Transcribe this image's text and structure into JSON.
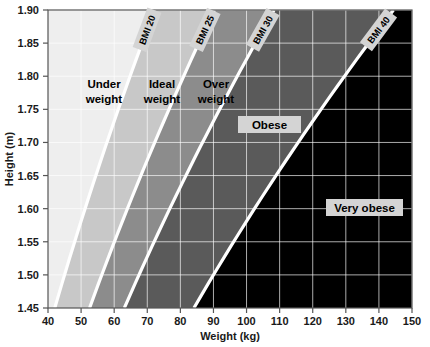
{
  "chart_data": {
    "type": "line",
    "title": "",
    "xlabel": "Weight (kg)",
    "ylabel": "Height (m)",
    "xlim": [
      40,
      150
    ],
    "ylim": [
      1.45,
      1.9
    ],
    "grid": true,
    "legend_position": "none",
    "x_ticks": [
      "40",
      "50",
      "60",
      "70",
      "80",
      "90",
      "100",
      "110",
      "120",
      "130",
      "140",
      "150"
    ],
    "x_tick_values": [
      40,
      50,
      60,
      70,
      80,
      90,
      100,
      110,
      120,
      130,
      140,
      150
    ],
    "y_ticks": [
      "1.45",
      "1.50",
      "1.55",
      "1.60",
      "1.65",
      "1.70",
      "1.75",
      "1.80",
      "1.85",
      "1.90"
    ],
    "y_tick_values": [
      1.45,
      1.5,
      1.55,
      1.6,
      1.65,
      1.7,
      1.75,
      1.8,
      1.85,
      1.9
    ],
    "series": [
      {
        "name": "BMI 20",
        "bmi": 20,
        "label": "BMI 20",
        "points": [
          {
            "height": 1.45,
            "weight": 42.1
          },
          {
            "height": 1.9,
            "weight": 72.2
          }
        ]
      },
      {
        "name": "BMI 25",
        "bmi": 25,
        "label": "BMI 25",
        "points": [
          {
            "height": 1.45,
            "weight": 52.6
          },
          {
            "height": 1.9,
            "weight": 90.3
          }
        ]
      },
      {
        "name": "BMI 30",
        "bmi": 30,
        "label": "BMI 30",
        "points": [
          {
            "height": 1.45,
            "weight": 63.1
          },
          {
            "height": 1.9,
            "weight": 108.3
          }
        ]
      },
      {
        "name": "BMI 40",
        "bmi": 40,
        "label": "BMI 40",
        "points": [
          {
            "height": 1.45,
            "weight": 84.1
          },
          {
            "height": 1.9,
            "weight": 144.4
          }
        ]
      }
    ],
    "regions": [
      {
        "name": "under-weight",
        "label_line1": "Under",
        "label_line2": "weight",
        "bmi_range": [
          0,
          20
        ],
        "fill": "#eeeeee",
        "boxed": false
      },
      {
        "name": "ideal-weight",
        "label_line1": "Ideal",
        "label_line2": "weight",
        "bmi_range": [
          20,
          25
        ],
        "fill": "#c8c8c8",
        "boxed": false
      },
      {
        "name": "over-weight",
        "label_line1": "Over",
        "label_line2": "weight",
        "bmi_range": [
          25,
          30
        ],
        "fill": "#8c8c8c",
        "boxed": false
      },
      {
        "name": "obese",
        "label_line1": "Obese",
        "label_line2": "",
        "bmi_range": [
          30,
          40
        ],
        "fill": "#5a5a5a",
        "boxed": true
      },
      {
        "name": "very-obese",
        "label_line1": "Very obese",
        "label_line2": "",
        "bmi_range": [
          40,
          999
        ],
        "fill": "#000000",
        "boxed": true
      }
    ],
    "colors": {
      "under_weight": "#eeeeee",
      "ideal_weight": "#c8c8c8",
      "over_weight": "#8c8c8c",
      "obese": "#5a5a5a",
      "very_obese": "#000000",
      "bmi_line": "#ffffff",
      "grid": "#ffffff",
      "axis": "#555555",
      "label_box": "#d4d4d4",
      "background": "#ffffff"
    }
  }
}
